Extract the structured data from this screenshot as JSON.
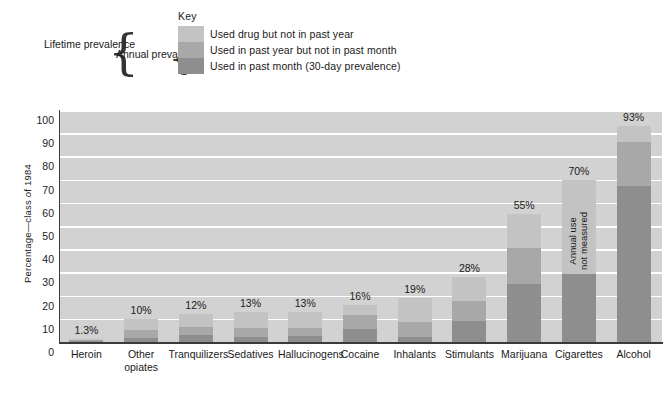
{
  "key": {
    "title": "Key",
    "items": [
      {
        "label": "Used drug but not in past year",
        "color": "#c3c3c3"
      },
      {
        "label": "Used in past year but not in past month",
        "color": "#a8a8a8"
      },
      {
        "label": "Used in past month (30-day prevalence)",
        "color": "#8e8e8e"
      }
    ],
    "brackets": [
      {
        "label": "Lifetime\nprevalence"
      },
      {
        "label": "Annual\nprevalence"
      }
    ]
  },
  "chart_data": {
    "type": "bar",
    "stacked": true,
    "title": "",
    "subtitle": "",
    "xlabel": "",
    "ylabel": "Percentage—class of 1984",
    "ylim": [
      0,
      100
    ],
    "yticks": [
      0,
      10,
      20,
      30,
      40,
      50,
      60,
      70,
      80,
      90,
      100
    ],
    "ytick_labels": [
      "0",
      "10",
      "20",
      "30",
      "40",
      "50",
      "60",
      "70",
      "80",
      "90",
      "100"
    ],
    "grid": true,
    "legend_position": "top",
    "categories": [
      "Heroin",
      "Other\nopiates",
      "Tranquilizers",
      "Sedatives",
      "Hallucinogens",
      "Cocaine",
      "Inhalants",
      "Stimulants",
      "Marijuana",
      "Cigarettes",
      "Alcohol"
    ],
    "series": [
      {
        "name": "Used in past month (30-day prevalence)",
        "color": "#8e8e8e",
        "values": [
          0.3,
          1.8,
          3.1,
          2.3,
          2.6,
          5.8,
          2.2,
          8.9,
          25.2,
          29.3,
          67.2
        ]
      },
      {
        "name": "Used in past year but not in past month",
        "color": "#a8a8a8",
        "values": [
          0.4,
          3.2,
          3.4,
          3.7,
          3.6,
          5.8,
          6.3,
          8.9,
          15.3,
          0,
          18.8
        ]
      },
      {
        "name": "Used drug but not in past year",
        "color": "#c3c3c3",
        "values": [
          0.6,
          5.0,
          5.5,
          7.0,
          6.8,
          4.4,
          10.5,
          10.2,
          14.5,
          40.7,
          7.0
        ]
      }
    ],
    "totals": [
      1.3,
      10,
      12,
      13,
      13,
      16,
      19,
      28,
      55,
      70,
      93
    ],
    "value_labels": [
      "1.3%",
      "10%",
      "12%",
      "13%",
      "13%",
      "16%",
      "19%",
      "28%",
      "55%",
      "70%",
      "93%"
    ],
    "annotations": [
      {
        "category": "Cigarettes",
        "text": "Annual use\nnot measured",
        "rotated": true
      }
    ],
    "colors": {
      "plot_background": "#d2d2d2",
      "gridline": "#ffffff",
      "axis": "#3b3b3b",
      "text": "#1a1a1a"
    }
  }
}
